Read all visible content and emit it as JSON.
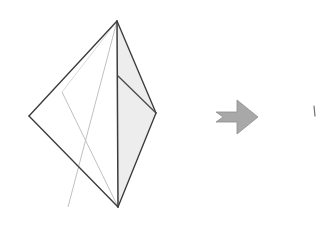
{
  "page": {
    "width": 321,
    "height": 229,
    "background_color": "#ffffff"
  },
  "colors": {
    "outline_dark": "#3b3b3b",
    "outline_mid": "#5a5a5a",
    "hidden_line_light": "#b9b9b9",
    "face_fill_light_gray": "#ededed",
    "face_fill_white": "#ffffff",
    "arrow_fill": "#a8a8a8",
    "arrow_stroke": "#8e8e8e",
    "speck": "#6e6e6e"
  },
  "figures": {
    "tetrahedron": {
      "label": "tetrahedron-solid",
      "description": "Wireframe tetrahedron with one shaded right face and light hidden edges",
      "vertices": {
        "apex": [
          117,
          21
        ],
        "left": [
          29,
          116
        ],
        "right": [
          156,
          113
        ],
        "bottom": [
          118,
          207
        ],
        "fold": [
          118,
          76
        ],
        "cross_center": [
          85,
          114
        ]
      },
      "faces": [
        {
          "name": "front-left-face",
          "points": "117,21 29,116 118,207",
          "fill": "#ffffff"
        },
        {
          "name": "right-shaded-upper-face",
          "points": "117,21 156,113 118,76",
          "fill": "#ededed"
        },
        {
          "name": "right-shaded-lower-face",
          "points": "118,76 156,113 118,207",
          "fill": "#ededed"
        }
      ],
      "edges": [
        {
          "name": "edge-apex-left",
          "points": "117,21 29,116",
          "stroke": "#3b3b3b",
          "width": 1.35
        },
        {
          "name": "edge-left-bottom",
          "points": "29,116 118,207",
          "stroke": "#3b3b3b",
          "width": 1.35
        },
        {
          "name": "edge-apex-bottom",
          "points": "117,21 118,207",
          "stroke": "#3b3b3b",
          "width": 1.5
        },
        {
          "name": "edge-apex-right",
          "points": "117,21 156,113",
          "stroke": "#3b3b3b",
          "width": 1.35
        },
        {
          "name": "edge-right-bottom",
          "points": "156,113 118,207",
          "stroke": "#3b3b3b",
          "width": 1.35
        },
        {
          "name": "edge-fold-right",
          "points": "118,76 156,113",
          "stroke": "#4a4a4a",
          "width": 1.3
        }
      ],
      "hidden_edges": [
        {
          "name": "hidden-apex-to-lower-left",
          "points": "117,21 68,207",
          "stroke": "#b9b9b9",
          "width": 0.9
        },
        {
          "name": "hidden-left-to-bottom-node",
          "points": "62,92 118,207",
          "stroke": "#b9b9b9",
          "width": 0.9
        },
        {
          "name": "hidden-cross-left-stub",
          "points": "62,92 117,21",
          "stroke": "#c9c9c9",
          "width": 0.7
        }
      ]
    },
    "arrow": {
      "label": "transformation-arrow",
      "direction": "right",
      "points": "216,112 237,112 237,100 258,117 237,134 237,122 216,122 223,117",
      "fill": "#a8a8a8",
      "stroke": "#8e8e8e",
      "bounds": {
        "x": 216,
        "y": 100,
        "width": 42,
        "height": 34
      }
    },
    "clipped_figure": {
      "label": "clipped-right-figure-edge",
      "description": "Sliver of a second figure cut off by the right image border",
      "points": "314,106 315,116",
      "stroke": "#6e6e6e",
      "width": 1.2
    }
  }
}
